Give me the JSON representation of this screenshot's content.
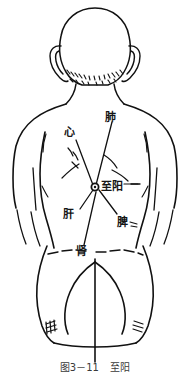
{
  "figure": {
    "title_caption": {
      "number": "图3－11",
      "separator": "",
      "name": "至阳"
    },
    "view": "human back, posterior view",
    "acupoint": {
      "name": "至阳",
      "marker": "acupoint-dot",
      "x": 95,
      "y": 187
    },
    "labels": [
      {
        "id": "lung",
        "text": "肺",
        "x": 105,
        "y": 113,
        "leader_to_x": 95,
        "leader_to_y": 186
      },
      {
        "id": "heart",
        "text": "心",
        "x": 64,
        "y": 128,
        "leader_to_x": 93,
        "leader_to_y": 185
      },
      {
        "id": "zhiyang",
        "text": "至阳",
        "x": 102,
        "y": 182,
        "leader_to_x": 97,
        "leader_to_y": 187
      },
      {
        "id": "liver",
        "text": "肝",
        "x": 63,
        "y": 210,
        "leader_to_x": 93,
        "leader_to_y": 190
      },
      {
        "id": "spleen",
        "text": "脾",
        "x": 117,
        "y": 218,
        "leader_to_x": 98,
        "leader_to_y": 190
      },
      {
        "id": "kidney",
        "text": "肾",
        "x": 76,
        "y": 247,
        "leader_to_x": 96,
        "leader_to_y": 191
      }
    ],
    "colors": {
      "ink": "#111111",
      "background": "#ffffff",
      "caption_ink": "#3a3a3a"
    }
  }
}
